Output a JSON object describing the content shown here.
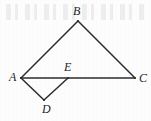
{
  "figure": {
    "type": "line-diagram",
    "canvas": {
      "width": 151,
      "height": 121
    },
    "background_color": "#fdfdfd",
    "stroke_color": "#2b2b2b",
    "stroke_width": 1.5,
    "label_color": "#242424",
    "points": [
      {
        "id": "A",
        "label": "A",
        "x": 21,
        "y": 78,
        "label_x": 9,
        "label_y": 71
      },
      {
        "id": "B",
        "label": "B",
        "x": 78,
        "y": 21,
        "label_x": 73,
        "label_y": 5
      },
      {
        "id": "C",
        "label": "C",
        "x": 135,
        "y": 78,
        "label_x": 139,
        "label_y": 72
      },
      {
        "id": "D",
        "label": "D",
        "x": 44,
        "y": 100,
        "label_x": 42,
        "label_y": 103
      },
      {
        "id": "E",
        "label": "E",
        "x": 68,
        "y": 78,
        "label_x": 64,
        "label_y": 61
      }
    ],
    "segments": [
      {
        "id": "AB",
        "from": "A",
        "to": "B"
      },
      {
        "id": "BC",
        "from": "B",
        "to": "C"
      },
      {
        "id": "AC",
        "from": "A",
        "to": "C"
      },
      {
        "id": "AD",
        "from": "A",
        "to": "D"
      },
      {
        "id": "DE",
        "from": "D",
        "to": "E"
      }
    ]
  }
}
